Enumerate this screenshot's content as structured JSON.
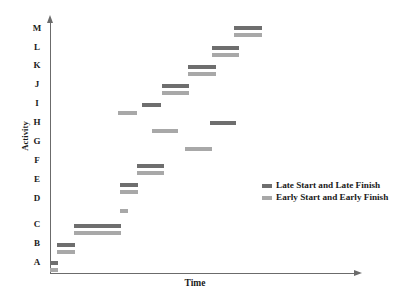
{
  "chart_data": {
    "type": "bar",
    "chart_kind": "gantt-float-chart",
    "title": "",
    "xlabel": "Time",
    "ylabel": "Activity",
    "grid": false,
    "legend_position": "right-middle",
    "x_axis": {
      "label": "Time",
      "ticks": [],
      "tick_labels": [],
      "arrow": true,
      "range_note": "unitless time axis, no tick marks shown"
    },
    "y_axis": {
      "label": "Activity",
      "categories": [
        "A",
        "B",
        "C",
        "D",
        "E",
        "F",
        "G",
        "H",
        "I",
        "J",
        "K",
        "L",
        "M"
      ],
      "order_bottom_to_top": true,
      "arrow": true
    },
    "series": [
      {
        "name": "Late Start and Late Finish",
        "color": "#6e6e6e",
        "key": "late"
      },
      {
        "name": "Early Start and Early Finish",
        "color": "#a8a8a8",
        "key": "early"
      }
    ],
    "bars": [
      {
        "activity": "M",
        "series": "late",
        "x_start": 234,
        "x_end": 262,
        "y": 26
      },
      {
        "activity": "M",
        "series": "early",
        "x_start": 234,
        "x_end": 262,
        "y": 33
      },
      {
        "activity": "L",
        "series": "late",
        "x_start": 212,
        "x_end": 239,
        "y": 46
      },
      {
        "activity": "L",
        "series": "early",
        "x_start": 212,
        "x_end": 239,
        "y": 53
      },
      {
        "activity": "K",
        "series": "late",
        "x_start": 188,
        "x_end": 216,
        "y": 65
      },
      {
        "activity": "K",
        "series": "early",
        "x_start": 188,
        "x_end": 216,
        "y": 72
      },
      {
        "activity": "J",
        "series": "late",
        "x_start": 162,
        "x_end": 189,
        "y": 84
      },
      {
        "activity": "J",
        "series": "early",
        "x_start": 162,
        "x_end": 189,
        "y": 91
      },
      {
        "activity": "I",
        "series": "late",
        "x_start": 142,
        "x_end": 161,
        "y": 103
      },
      {
        "activity": "I",
        "series": "early",
        "x_start": 118,
        "x_end": 137,
        "y": 111
      },
      {
        "activity": "H",
        "series": "late",
        "x_start": 210,
        "x_end": 236,
        "y": 121
      },
      {
        "activity": "H",
        "series": "early",
        "x_start": 152,
        "x_end": 178,
        "y": 129
      },
      {
        "activity": "G",
        "series": "early",
        "x_start": 185,
        "x_end": 212,
        "y": 147
      },
      {
        "activity": "F",
        "series": "late",
        "x_start": 137,
        "x_end": 164,
        "y": 164
      },
      {
        "activity": "F",
        "series": "early",
        "x_start": 137,
        "x_end": 164,
        "y": 171
      },
      {
        "activity": "E",
        "series": "late",
        "x_start": 120,
        "x_end": 138,
        "y": 183
      },
      {
        "activity": "E",
        "series": "early",
        "x_start": 120,
        "x_end": 138,
        "y": 190
      },
      {
        "activity": "D",
        "series": "early",
        "x_start": 120,
        "x_end": 128,
        "y": 209
      },
      {
        "activity": "C",
        "series": "late",
        "x_start": 74,
        "x_end": 121,
        "y": 224
      },
      {
        "activity": "C",
        "series": "early",
        "x_start": 74,
        "x_end": 121,
        "y": 231
      },
      {
        "activity": "B",
        "series": "late",
        "x_start": 57,
        "x_end": 75,
        "y": 243
      },
      {
        "activity": "B",
        "series": "early",
        "x_start": 57,
        "x_end": 75,
        "y": 250
      },
      {
        "activity": "A",
        "series": "late",
        "x_start": 50,
        "x_end": 58,
        "y": 261
      },
      {
        "activity": "A",
        "series": "early",
        "x_start": 50,
        "x_end": 58,
        "y": 268
      }
    ],
    "category_label_positions": [
      {
        "label": "M",
        "y": 28
      },
      {
        "label": "L",
        "y": 47
      },
      {
        "label": "K",
        "y": 65
      },
      {
        "label": "J",
        "y": 84
      },
      {
        "label": "I",
        "y": 103
      },
      {
        "label": "H",
        "y": 122
      },
      {
        "label": "G",
        "y": 141
      },
      {
        "label": "F",
        "y": 160
      },
      {
        "label": "E",
        "y": 179
      },
      {
        "label": "D",
        "y": 198
      },
      {
        "label": "C",
        "y": 224
      },
      {
        "label": "B",
        "y": 243
      },
      {
        "label": "A",
        "y": 262
      }
    ],
    "colors": {
      "late": "#6e6e6e",
      "early": "#a8a8a8",
      "axis": "#6b6b6b",
      "text": "#1a1a1a",
      "background": "#ffffff"
    }
  },
  "legend": {
    "items": [
      {
        "label": "Late Start and Late Finish",
        "color": "#6e6e6e"
      },
      {
        "label": "Early Start and Early Finish",
        "color": "#a8a8a8"
      }
    ]
  }
}
